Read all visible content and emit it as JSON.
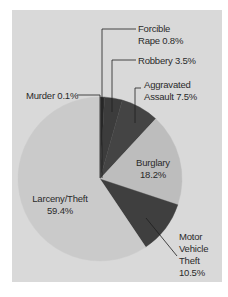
{
  "chart_data": {
    "type": "pie",
    "title": "",
    "start_angle": "12 o'clock",
    "direction": "clockwise",
    "categories": [
      "Murder",
      "Forcible Rape",
      "Robbery",
      "Aggravated Assault",
      "Burglary",
      "Motor Vehicle Theft",
      "Larceny/Theft"
    ],
    "values": [
      0.1,
      0.8,
      3.5,
      7.5,
      18.2,
      10.5,
      59.4
    ],
    "unit": "%",
    "colors": [
      "#3a3a3a",
      "#2e2e2e",
      "#3c3c3c",
      "#444444",
      "#bdbdbd",
      "#3f3f3f",
      "#cacaca"
    ],
    "legend": "none (leader-line labels)"
  },
  "labels": {
    "murder": "Murder 0.1%",
    "rape_line1": "Forcible",
    "rape_line2": "Rape 0.8%",
    "robbery": "Robbery 3.5%",
    "assault_line1": "Aggravated",
    "assault_line2": "Assault 7.5%",
    "burglary_line1": "Burglary",
    "burglary_line2": "18.2%",
    "larceny_line1": "Larceny/Theft",
    "larceny_line2": "59.4%",
    "mvt_line1": "Motor",
    "mvt_line2": "Vehicle",
    "mvt_line3": "Theft",
    "mvt_line4": "10.5%"
  },
  "colors": {
    "background": "#d9d9d9",
    "text": "#2a2a2a",
    "leader": "#1e1e1e"
  }
}
